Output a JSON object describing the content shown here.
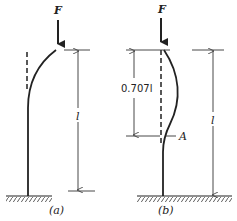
{
  "figure": {
    "panel_a": {
      "force_label": "F",
      "length_label": "l",
      "caption": "(a)"
    },
    "panel_b": {
      "force_label": "F",
      "partial_length_label": "0.707l",
      "point_label": "A",
      "length_label": "l",
      "caption": "(b)"
    },
    "colors": {
      "ink": "#222222",
      "background": "#ffffff"
    }
  }
}
